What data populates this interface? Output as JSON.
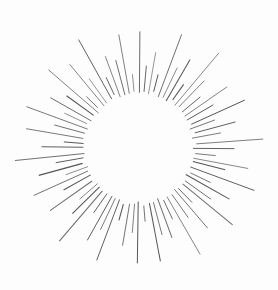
{
  "artwork": {
    "title": "Sunburst Ray Starburst",
    "subject": "sunburst",
    "style": "engraved line art",
    "description": "Radiating straight rays of alternating length forming a starburst ring around an empty circular center",
    "background_color": "#fdfdfd",
    "stroke_color": "#555555",
    "stroke_color_light": "#6e6e6e",
    "stroke_width": 0.9,
    "canvas": {
      "width": 278,
      "height": 290
    },
    "geometry": {
      "center_x": 139,
      "center_y": 148,
      "inner_radius": 55,
      "outer_radius_min": 74,
      "outer_radius_max": 124,
      "ray_count": 72
    },
    "rays": [
      {
        "angle": 0,
        "inner": 55,
        "outer": 115
      },
      {
        "angle": 5,
        "inner": 56,
        "outer": 82
      },
      {
        "angle": 10,
        "inner": 55,
        "outer": 99
      },
      {
        "angle": 15,
        "inner": 57,
        "outer": 76
      },
      {
        "angle": 20,
        "inner": 55,
        "outer": 120
      },
      {
        "angle": 25,
        "inner": 56,
        "outer": 88
      },
      {
        "angle": 30,
        "inner": 55,
        "outer": 104
      },
      {
        "angle": 35,
        "inner": 57,
        "outer": 78
      },
      {
        "angle": 40,
        "inner": 55,
        "outer": 122
      },
      {
        "angle": 45,
        "inner": 56,
        "outer": 92
      },
      {
        "angle": 50,
        "inner": 55,
        "outer": 80
      },
      {
        "angle": 55,
        "inner": 57,
        "outer": 108
      },
      {
        "angle": 60,
        "inner": 55,
        "outer": 86
      },
      {
        "angle": 65,
        "inner": 56,
        "outer": 118
      },
      {
        "angle": 70,
        "inner": 55,
        "outer": 79
      },
      {
        "angle": 75,
        "inner": 57,
        "outer": 101
      },
      {
        "angle": 80,
        "inner": 55,
        "outer": 84
      },
      {
        "angle": 85,
        "inner": 56,
        "outer": 124
      },
      {
        "angle": 90,
        "inner": 55,
        "outer": 95
      },
      {
        "angle": 95,
        "inner": 57,
        "outer": 77
      },
      {
        "angle": 100,
        "inner": 55,
        "outer": 112
      },
      {
        "angle": 105,
        "inner": 56,
        "outer": 87
      },
      {
        "angle": 110,
        "inner": 55,
        "outer": 121
      },
      {
        "angle": 115,
        "inner": 57,
        "outer": 81
      },
      {
        "angle": 120,
        "inner": 55,
        "outer": 103
      },
      {
        "angle": 125,
        "inner": 56,
        "outer": 90
      },
      {
        "angle": 130,
        "inner": 55,
        "outer": 119
      },
      {
        "angle": 135,
        "inner": 57,
        "outer": 76
      },
      {
        "angle": 140,
        "inner": 55,
        "outer": 106
      },
      {
        "angle": 145,
        "inner": 56,
        "outer": 85
      },
      {
        "angle": 150,
        "inner": 55,
        "outer": 123
      },
      {
        "angle": 155,
        "inner": 57,
        "outer": 79
      },
      {
        "angle": 160,
        "inner": 55,
        "outer": 98
      },
      {
        "angle": 165,
        "inner": 56,
        "outer": 89
      },
      {
        "angle": 170,
        "inner": 55,
        "outer": 116
      },
      {
        "angle": 175,
        "inner": 57,
        "outer": 75
      },
      {
        "angle": 180,
        "inner": 55,
        "outer": 114
      },
      {
        "angle": 185,
        "inner": 56,
        "outer": 83
      },
      {
        "angle": 190,
        "inner": 55,
        "outer": 100
      },
      {
        "angle": 195,
        "inner": 57,
        "outer": 77
      },
      {
        "angle": 200,
        "inner": 55,
        "outer": 120
      },
      {
        "angle": 205,
        "inner": 56,
        "outer": 91
      },
      {
        "angle": 210,
        "inner": 55,
        "outer": 105
      },
      {
        "angle": 215,
        "inner": 57,
        "outer": 78
      },
      {
        "angle": 220,
        "inner": 55,
        "outer": 122
      },
      {
        "angle": 225,
        "inner": 56,
        "outer": 93
      },
      {
        "angle": 230,
        "inner": 55,
        "outer": 80
      },
      {
        "angle": 235,
        "inner": 57,
        "outer": 109
      },
      {
        "angle": 240,
        "inner": 55,
        "outer": 86
      },
      {
        "angle": 245,
        "inner": 56,
        "outer": 117
      },
      {
        "angle": 250,
        "inner": 55,
        "outer": 79
      },
      {
        "angle": 255,
        "inner": 57,
        "outer": 102
      },
      {
        "angle": 260,
        "inner": 55,
        "outer": 84
      },
      {
        "angle": 265,
        "inner": 56,
        "outer": 124
      },
      {
        "angle": 270,
        "inner": 55,
        "outer": 96
      },
      {
        "angle": 275,
        "inner": 57,
        "outer": 76
      },
      {
        "angle": 280,
        "inner": 55,
        "outer": 113
      },
      {
        "angle": 285,
        "inner": 56,
        "outer": 88
      },
      {
        "angle": 290,
        "inner": 55,
        "outer": 121
      },
      {
        "angle": 295,
        "inner": 57,
        "outer": 82
      },
      {
        "angle": 300,
        "inner": 55,
        "outer": 104
      },
      {
        "angle": 305,
        "inner": 56,
        "outer": 90
      },
      {
        "angle": 310,
        "inner": 55,
        "outer": 118
      },
      {
        "angle": 315,
        "inner": 57,
        "outer": 75
      },
      {
        "angle": 320,
        "inner": 55,
        "outer": 107
      },
      {
        "angle": 325,
        "inner": 56,
        "outer": 85
      },
      {
        "angle": 330,
        "inner": 55,
        "outer": 123
      },
      {
        "angle": 335,
        "inner": 57,
        "outer": 80
      },
      {
        "angle": 340,
        "inner": 55,
        "outer": 97
      },
      {
        "angle": 345,
        "inner": 56,
        "outer": 89
      },
      {
        "angle": 350,
        "inner": 55,
        "outer": 115
      },
      {
        "angle": 355,
        "inner": 57,
        "outer": 74
      }
    ]
  }
}
